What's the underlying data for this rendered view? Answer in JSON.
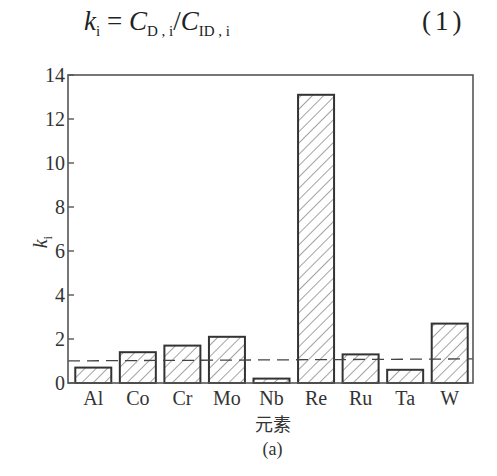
{
  "equation": {
    "lhs": "k",
    "lhs_sub": "i",
    "eq": " = ",
    "num": "C",
    "num_sub": "D , i",
    "slash": "/",
    "den": "C",
    "den_sub": "ID , i",
    "number": "(1)"
  },
  "chart_data": {
    "type": "bar",
    "title": "",
    "categories": [
      "Al",
      "Co",
      "Cr",
      "Mo",
      "Nb",
      "Re",
      "Ru",
      "Ta",
      "W"
    ],
    "values": [
      0.7,
      1.4,
      1.7,
      2.1,
      0.2,
      13.1,
      1.3,
      0.6,
      2.7
    ],
    "xlabel": "元素",
    "ylabel": "k_i",
    "ylabel_main": "k",
    "ylabel_sub": "i",
    "ylim": [
      0,
      14
    ],
    "yticks": [
      0,
      2,
      4,
      6,
      8,
      10,
      12,
      14
    ],
    "reference_line": {
      "y": 1.05,
      "style": "dashed"
    },
    "bar_fill": "diagonal-hatch",
    "grid": false,
    "legend": "none",
    "sub_caption": "(a)"
  },
  "colors": {
    "axis": "#555555",
    "bar_edge": "#333333",
    "hatch": "#555555",
    "text": "#333333"
  }
}
